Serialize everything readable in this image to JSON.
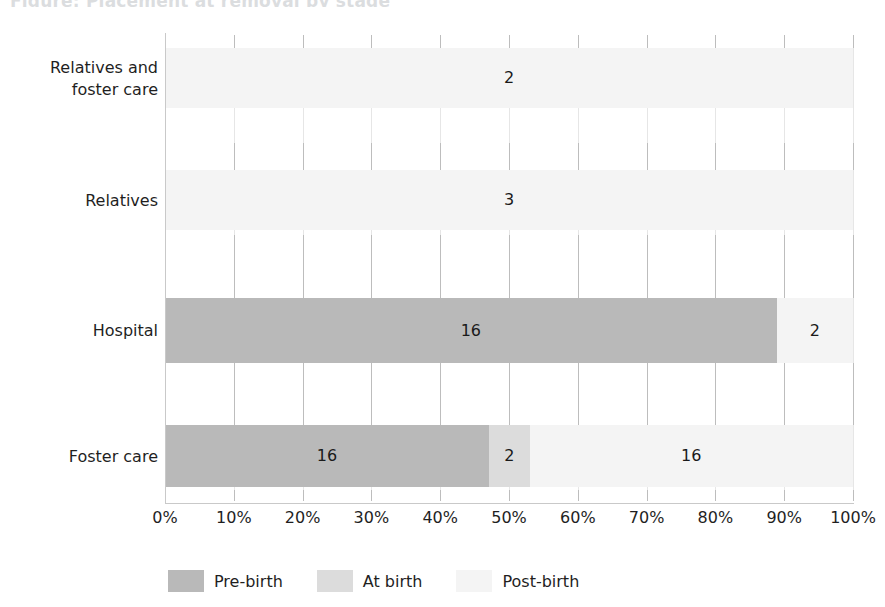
{
  "chart_data": {
    "type": "bar",
    "orientation": "horizontal",
    "stacked": true,
    "normalized": true,
    "title": "Figure: Placement at removal by stage",
    "xlabel": "",
    "ylabel": "",
    "xlim": [
      0,
      100
    ],
    "grid": true,
    "legend_position": "bottom",
    "categories": [
      "Relatives and foster care",
      "Relatives",
      "Hospital",
      "Foster care"
    ],
    "category_lines": [
      [
        "Relatives and",
        "foster care"
      ],
      [
        "Relatives"
      ],
      [
        "Hospital"
      ],
      [
        "Foster care"
      ]
    ],
    "tick_labels": [
      "0%",
      "10%",
      "20%",
      "30%",
      "40%",
      "50%",
      "60%",
      "70%",
      "80%",
      "90%",
      "100%"
    ],
    "tick_values": [
      0,
      10,
      20,
      30,
      40,
      50,
      60,
      70,
      80,
      90,
      100
    ],
    "series": [
      {
        "name": "Pre-birth",
        "color": "#b9b9b9",
        "values": [
          0,
          0,
          16,
          16
        ],
        "percents": [
          0,
          0,
          88.9,
          47.1
        ]
      },
      {
        "name": "At birth",
        "color": "#dcdcdc",
        "values": [
          0,
          0,
          0,
          2
        ],
        "percents": [
          0,
          0,
          0,
          5.9
        ]
      },
      {
        "name": "Post-birth",
        "color": "#f4f4f4",
        "values": [
          2,
          3,
          2,
          16
        ],
        "percents": [
          100,
          100,
          11.1,
          47.0
        ]
      }
    ],
    "bar_labels": [
      [
        {
          "series": "Post-birth",
          "text": "2"
        }
      ],
      [
        {
          "series": "Post-birth",
          "text": "3"
        }
      ],
      [
        {
          "series": "Pre-birth",
          "text": "16"
        },
        {
          "series": "Post-birth",
          "text": "2"
        }
      ],
      [
        {
          "series": "Pre-birth",
          "text": "16"
        },
        {
          "series": "At birth",
          "text": "2"
        },
        {
          "series": "Post-birth",
          "text": "16"
        }
      ]
    ]
  },
  "legend": {
    "items": [
      {
        "label": "Pre-birth",
        "color": "#b9b9b9"
      },
      {
        "label": "At birth",
        "color": "#dcdcdc"
      },
      {
        "label": "Post-birth",
        "color": "#f4f4f4"
      }
    ]
  },
  "colors": {
    "pre_birth": "#b9b9b9",
    "at_birth": "#dcdcdc",
    "post_birth": "#f4f4f4",
    "axis": "#c9c9c9",
    "grid": "#e6e6e6",
    "text": "#1f1f1f",
    "background": "#ffffff"
  }
}
